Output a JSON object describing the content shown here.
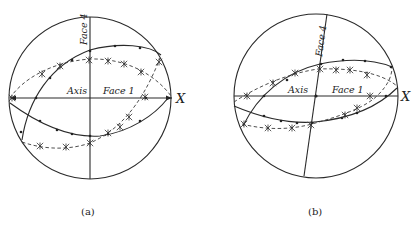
{
  "figure": {
    "panels": [
      {
        "id": "a",
        "caption": "(a)",
        "labels": {
          "axis": "Axis",
          "face1": "Face 1",
          "face4": "Face 4",
          "x": "X"
        }
      },
      {
        "id": "b",
        "caption": "(b)",
        "labels": {
          "axis": "Axis",
          "face1": "Face 1",
          "face4": "Face 4",
          "x": "X"
        }
      }
    ]
  },
  "colors": {
    "ink": "#222222",
    "background": "#ffffff"
  }
}
